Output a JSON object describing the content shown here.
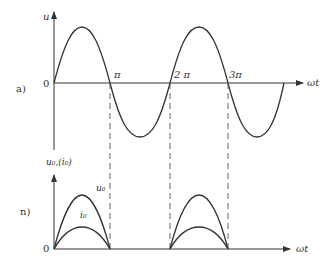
{
  "figure": {
    "panel_a": {
      "label": "a)",
      "y_axis_label": "u",
      "origin_label": "0",
      "x_axis_label": "ωt",
      "ticks": [
        {
          "label": "π",
          "x": 110
        },
        {
          "label": "2 π",
          "x": 170
        },
        {
          "label": "3π",
          "x": 228
        }
      ],
      "curve": "sine, amplitude 55px, period 2π (~116px), from 0 to ~4π"
    },
    "panel_b": {
      "label": "n)",
      "y_axis_label": "u₀,(i₀)",
      "origin_label": "0",
      "x_axis_label": "ωt",
      "curve_labels": {
        "u0": "u₀",
        "i0": "i₀"
      },
      "curve": "half-wave rectified: conduction on 0–π and 2π–3π; u₀ taller, i₀ shorter"
    },
    "colors": {
      "stroke": "#333333",
      "dash": "#555555"
    }
  }
}
